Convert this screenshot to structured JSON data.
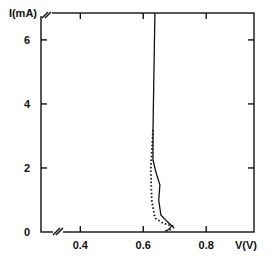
{
  "chart_data": {
    "type": "line",
    "title": "",
    "xlabel": "V(V)",
    "ylabel": "I(mA)",
    "xlim": [
      0.275,
      0.952
    ],
    "ylim": [
      0,
      6.84
    ],
    "x_ticks": [
      {
        "value": 0.4,
        "label": "0.4"
      },
      {
        "value": 0.6,
        "label": "0.6"
      },
      {
        "value": 0.8,
        "label": "0.8"
      }
    ],
    "y_ticks": [
      {
        "value": 0,
        "label": "0"
      },
      {
        "value": 2,
        "label": "2"
      },
      {
        "value": 4,
        "label": "4"
      },
      {
        "value": 6,
        "label": "6"
      }
    ],
    "axis_breaks": [
      "x-axis near origin",
      "y-axis near top"
    ],
    "grid": false,
    "legend": null,
    "series": [
      {
        "name": "solid",
        "style": "solid",
        "points": [
          [
            0.637,
            6.84
          ],
          [
            0.631,
            3.19
          ],
          [
            0.631,
            2.25
          ],
          [
            0.64,
            1.88
          ],
          [
            0.653,
            1.47
          ],
          [
            0.649,
            1.0
          ],
          [
            0.656,
            0.53
          ],
          [
            0.678,
            0.31
          ],
          [
            0.691,
            0.19
          ],
          [
            0.678,
            0.06
          ],
          [
            0.669,
            0.03
          ]
        ]
      },
      {
        "name": "dotted",
        "style": "dotted",
        "points": [
          [
            0.631,
            3.19
          ],
          [
            0.624,
            1.94
          ],
          [
            0.627,
            1.0
          ],
          [
            0.637,
            0.44
          ],
          [
            0.662,
            0.28
          ],
          [
            0.7,
            0.16
          ],
          [
            0.678,
            0.03
          ]
        ]
      }
    ]
  }
}
